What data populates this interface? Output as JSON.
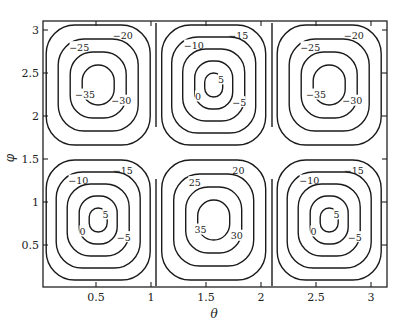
{
  "chart_data": {
    "type": "contour",
    "title": "",
    "xlabel": "θ",
    "ylabel": "φ",
    "xlim": [
      0,
      3.14159
    ],
    "ylim": [
      0,
      3.14159
    ],
    "xticks": [
      0.5,
      1,
      1.5,
      2,
      2.5,
      3
    ],
    "yticks": [
      0.5,
      1,
      1.5,
      2,
      2.5,
      3
    ],
    "xtick_labels": [
      "0.5",
      "1",
      "1.5",
      "2",
      "2.5",
      "3"
    ],
    "ytick_labels": [
      "0.5",
      "1",
      "1.5",
      "2",
      "2.5",
      "3"
    ],
    "grid": false,
    "legend": null,
    "separatrices": {
      "theta": [
        1.047,
        2.094
      ],
      "phi": [
        1.571
      ]
    },
    "cells": [
      {
        "name": "top-left",
        "theta_center": 0.52,
        "phi_center": 2.36,
        "levels": [
          -20,
          -25,
          -30,
          -35
        ],
        "extremum": -35
      },
      {
        "name": "top-middle",
        "theta_center": 1.57,
        "phi_center": 2.36,
        "levels": [
          -15,
          -10,
          -5,
          0,
          5
        ],
        "extremum": 5
      },
      {
        "name": "top-right",
        "theta_center": 2.62,
        "phi_center": 2.36,
        "levels": [
          -20,
          -25,
          -30,
          -35
        ],
        "extremum": -35
      },
      {
        "name": "bottom-left",
        "theta_center": 0.52,
        "phi_center": 0.79,
        "levels": [
          -15,
          -10,
          -5,
          0,
          5
        ],
        "extremum": 5
      },
      {
        "name": "bottom-middle",
        "theta_center": 1.57,
        "phi_center": 0.79,
        "levels": [
          20,
          25,
          30,
          35
        ],
        "extremum": 35
      },
      {
        "name": "bottom-right",
        "theta_center": 2.62,
        "phi_center": 0.79,
        "levels": [
          -15,
          -10,
          -5,
          0,
          5
        ],
        "extremum": 5
      }
    ],
    "contour_labels": [
      "-25",
      "-30",
      "-20",
      "-20",
      "-25",
      "-35",
      "-30",
      "-20",
      "-25",
      "-15",
      "-10",
      "-5",
      "0",
      "5",
      "-5",
      "-10",
      "-15",
      "-15",
      "-20",
      "-25",
      "-30",
      "20",
      "-35",
      "-25",
      "-30",
      "-20",
      "-20",
      "-15",
      "-15",
      "-10",
      "-5",
      "0",
      "5",
      "-5",
      "0",
      "-5",
      "-10",
      "-10",
      "-15",
      "20",
      "25",
      "-20",
      "20",
      "25",
      "30",
      "35",
      "30",
      "25",
      "20",
      "15",
      "-10",
      "-5",
      "-15",
      "-10",
      "-5",
      "0",
      "5",
      "5",
      "-10"
    ]
  }
}
